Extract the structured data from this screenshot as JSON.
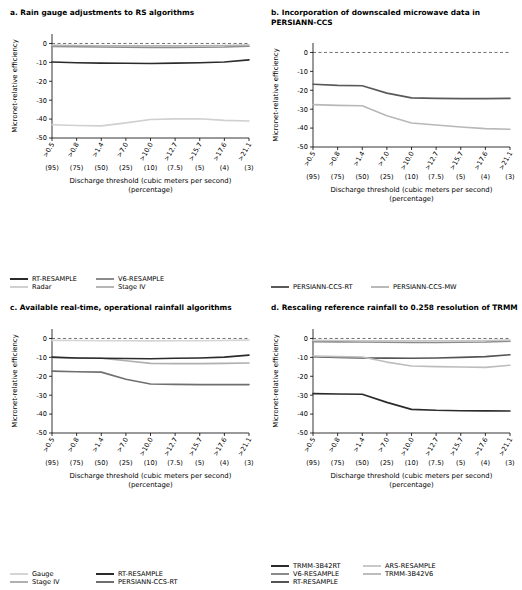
{
  "chart_data": [
    {
      "id": "a",
      "type": "line",
      "title": "a. Rain gauge adjustments to RS algorithms",
      "xlabel": "Discharge threshold (cubic meters per second) (percentage)",
      "ylabel": "Micronet-relative efficiency",
      "ylim": [
        -50,
        5
      ],
      "yticks": [
        0,
        -10,
        -20,
        -30,
        -40,
        -50
      ],
      "grid": false,
      "x": [
        ">0.5",
        ">0.8",
        ">1.4",
        ">7.0",
        ">10.0",
        ">12.7",
        ">15.7",
        ">17.6",
        ">21.1"
      ],
      "x_sub": [
        "(95)",
        "(75)",
        "(50)",
        "(25)",
        "(10)",
        "(7.5)",
        "(5)",
        "(4)",
        "(3)"
      ],
      "series": [
        {
          "name": "RT-RESAMPLE",
          "color": "#2b2b2b",
          "values": [
            -9.8,
            -10.2,
            -10.4,
            -10.5,
            -10.6,
            -10.4,
            -10.2,
            -9.8,
            -8.7
          ]
        },
        {
          "name": "V6-RESAMPLE",
          "color": "#8c8c8c",
          "values": [
            -1.6,
            -1.7,
            -1.9,
            -2.0,
            -2.1,
            -2.1,
            -2.0,
            -1.9,
            -1.5
          ]
        },
        {
          "name": "Radar",
          "color": "#d0d0d0",
          "values": [
            -43.0,
            -43.4,
            -43.6,
            -42.0,
            -40.2,
            -39.9,
            -39.8,
            -40.7,
            -41.0
          ]
        },
        {
          "name": "Stage IV",
          "color": "#b5b5b5",
          "values": [
            -1.0,
            -1.1,
            -1.2,
            -1.3,
            -1.3,
            -1.3,
            -1.2,
            -1.1,
            -0.9
          ]
        }
      ],
      "legend": [
        {
          "label": "RT-RESAMPLE",
          "color": "#2b2b2b"
        },
        {
          "label": "Radar",
          "color": "#d0d0d0"
        },
        {
          "label": "V6-RESAMPLE",
          "color": "#8c8c8c"
        },
        {
          "label": "Stage IV",
          "color": "#b5b5b5"
        }
      ]
    },
    {
      "id": "b",
      "type": "line",
      "title": "b. Incorporation of downscaled microwave data in PERSIANN-CCS",
      "xlabel": "Discharge threshold (cubic meters per second) (percentage)",
      "ylabel": "Micronet-relative efficiency",
      "ylim": [
        -50,
        5
      ],
      "yticks": [
        0,
        -10,
        -20,
        -30,
        -40,
        -50
      ],
      "grid": false,
      "x": [
        ">0.5",
        ">0.8",
        ">1.4",
        ">7.0",
        ">10.0",
        ">12.7",
        ">15.7",
        ">17.6",
        ">21.1"
      ],
      "x_sub": [
        "(95)",
        "(75)",
        "(50)",
        "(25)",
        "(10)",
        "(7.5)",
        "(5)",
        "(4)",
        "(3)"
      ],
      "series": [
        {
          "name": "PERSIANN-CCS-RT",
          "color": "#595959",
          "values": [
            -16.8,
            -17.4,
            -17.6,
            -21.5,
            -24.0,
            -24.3,
            -24.4,
            -24.4,
            -24.3
          ]
        },
        {
          "name": "PERSIANN-CCS-MW",
          "color": "#b8b8b8",
          "values": [
            -27.6,
            -28.0,
            -28.2,
            -33.5,
            -37.3,
            -38.4,
            -39.4,
            -40.3,
            -40.6
          ]
        }
      ],
      "legend": [
        {
          "label": "PERSIANN-CCS-RT",
          "color": "#595959"
        },
        {
          "label": "PERSIANN-CCS-MW",
          "color": "#b8b8b8"
        }
      ]
    },
    {
      "id": "c",
      "type": "line",
      "title": "c. Available real-time, operational rainfall algorithms",
      "xlabel": "Discharge threshold (cubic meters per second) (percentage)",
      "ylabel": "Micronet-relative efficiency",
      "ylim": [
        -50,
        5
      ],
      "yticks": [
        0,
        -10,
        -20,
        -30,
        -40,
        -50
      ],
      "grid": false,
      "x": [
        ">0.5",
        ">0.8",
        ">1.4",
        ">7.0",
        ">10.0",
        ">12.7",
        ">15.7",
        ">17.6",
        ">21.1"
      ],
      "x_sub": [
        "(95)",
        "(75)",
        "(50)",
        "(25)",
        "(10)",
        "(7.5)",
        "(5)",
        "(4)",
        "(3)"
      ],
      "series": [
        {
          "name": "Gauge",
          "color": "#d5d5d5",
          "values": [
            -1.0,
            -1.1,
            -1.2,
            -1.2,
            -1.3,
            -1.2,
            -1.2,
            -1.1,
            -0.9
          ]
        },
        {
          "name": "Stage IV",
          "color": "#b0b0b0",
          "values": [
            -10.1,
            -10.4,
            -10.5,
            -11.8,
            -13.2,
            -13.3,
            -13.3,
            -13.2,
            -13.0
          ]
        },
        {
          "name": "RT-RESAMPLE",
          "color": "#2b2b2b",
          "values": [
            -9.9,
            -10.3,
            -10.5,
            -10.6,
            -10.7,
            -10.5,
            -10.3,
            -9.9,
            -8.8
          ]
        },
        {
          "name": "PERSIANN-CCS-RT",
          "color": "#6f6f6f",
          "values": [
            -17.3,
            -17.6,
            -17.8,
            -21.6,
            -24.1,
            -24.3,
            -24.4,
            -24.4,
            -24.4
          ]
        }
      ],
      "legend": [
        {
          "label": "Gauge",
          "color": "#d5d5d5"
        },
        {
          "label": "Stage IV",
          "color": "#b0b0b0"
        },
        {
          "label": "RT-RESAMPLE",
          "color": "#2b2b2b"
        },
        {
          "label": "PERSIANN-CCS-RT",
          "color": "#6f6f6f"
        }
      ]
    },
    {
      "id": "d",
      "type": "line",
      "title": "d. Rescaling reference rainfall to 0.258 resolution of TRMM",
      "xlabel": "Discharge threshold (cubic meters per second) (percentage)",
      "ylabel": "Micronet-relative efficiency",
      "ylim": [
        -50,
        5
      ],
      "yticks": [
        0,
        -10,
        -20,
        -30,
        -40,
        -50
      ],
      "grid": false,
      "x": [
        ">0.5",
        ">0.8",
        ">1.4",
        ">7.0",
        ">10.0",
        ">12.7",
        ">15.7",
        ">17.6",
        ">21.1"
      ],
      "x_sub": [
        "(95)",
        "(75)",
        "(50)",
        "(25)",
        "(10)",
        "(7.5)",
        "(5)",
        "(4)",
        "(3)"
      ],
      "series": [
        {
          "name": "TRMM-3B42RT",
          "color": "#2b2b2b",
          "values": [
            -29.2,
            -29.4,
            -29.5,
            -33.8,
            -37.5,
            -38.0,
            -38.2,
            -38.3,
            -38.4
          ]
        },
        {
          "name": "RT-RESAMPLE",
          "color": "#555555",
          "values": [
            -9.7,
            -10.1,
            -10.3,
            -10.4,
            -10.5,
            -10.3,
            -10.0,
            -9.6,
            -8.6
          ]
        },
        {
          "name": "TRMM-3B42V6",
          "color": "#bdbdbd",
          "values": [
            -9.3,
            -9.6,
            -9.8,
            -12.5,
            -14.6,
            -14.9,
            -15.1,
            -15.3,
            -14.2
          ]
        },
        {
          "name": "V6-RESAMPLE",
          "color": "#8a8a8a",
          "values": [
            -1.7,
            -1.8,
            -1.9,
            -2.0,
            -2.1,
            -2.1,
            -2.0,
            -1.9,
            -1.5
          ]
        },
        {
          "name": "ARS-RESAMPLE",
          "color": "#c8c8c8",
          "values": [
            -1.0,
            -1.1,
            -1.2,
            -1.2,
            -1.3,
            -1.2,
            -1.2,
            -1.1,
            -0.9
          ]
        }
      ],
      "legend": [
        {
          "label": "TRMM-3B42RT",
          "color": "#2b2b2b"
        },
        {
          "label": "V6-RESAMPLE",
          "color": "#8a8a8a"
        },
        {
          "label": "RT-RESAMPLE",
          "color": "#555555"
        },
        {
          "label": "ARS-RESAMPLE",
          "color": "#c8c8c8"
        },
        {
          "label": "TRMM-3B42V6",
          "color": "#bdbdbd"
        }
      ]
    }
  ],
  "panels": {
    "a": {
      "title": "a. Rain gauge adjustments to RS algorithms",
      "ylabel": "Micronet-relative efficiency",
      "xlabel_line1": "Discharge threshold (cubic meters per second)",
      "xlabel_line2": "(percentage)"
    },
    "b": {
      "title": "b. Incorporation of downscaled microwave data in PERSIANN-CCS",
      "ylabel": "Micronet-relative efficiency",
      "xlabel_line1": "Discharge threshold (cubic meters per second)",
      "xlabel_line2": "(percentage)"
    },
    "c": {
      "title": "c. Available real-time, operational rainfall algorithms",
      "ylabel": "Micronet-relative efficiency",
      "xlabel_line1": "Discharge threshold (cubic meters per second)",
      "xlabel_line2": "(percentage)"
    },
    "d": {
      "title": "d. Rescaling reference rainfall to 0.258 resolution of TRMM",
      "ylabel": "Micronet-relative efficiency",
      "xlabel_line1": "Discharge threshold (cubic meters per second)",
      "xlabel_line2": "(percentage)"
    }
  }
}
